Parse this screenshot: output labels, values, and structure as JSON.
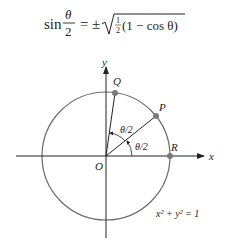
{
  "formula": {
    "lhs_fn": "sin",
    "lhs_num": "θ",
    "lhs_den": "2",
    "equals": "=",
    "pm": "±",
    "half_num": "1",
    "half_den": "2",
    "radicand": "(1 − cos θ)"
  },
  "diagram": {
    "axes": {
      "x_label": "x",
      "y_label": "y"
    },
    "origin_label": "O",
    "points": [
      {
        "label": "Q",
        "angle_deg": 82
      },
      {
        "label": "P",
        "angle_deg": 38
      },
      {
        "label": "R",
        "angle_deg": 0
      }
    ],
    "angle_labels": [
      "θ/2",
      "θ/2"
    ],
    "circle_equation": "x² + y² = 1",
    "colors": {
      "circle": "#6b6b6b",
      "axes": "#222222",
      "points": "#7a7a7a"
    }
  }
}
